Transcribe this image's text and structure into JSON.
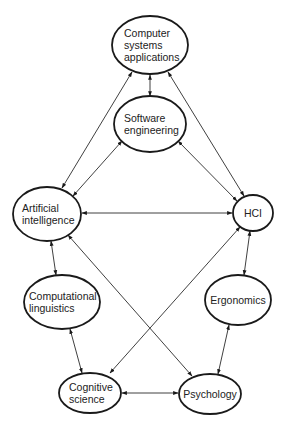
{
  "diagram": {
    "type": "relationship-network",
    "nodes": [
      {
        "id": "csa",
        "lines": [
          "Computer",
          "systems",
          "applications"
        ],
        "cx": 150,
        "cy": 45,
        "rx": 38,
        "ry": 29,
        "align": "start",
        "tx": 124
      },
      {
        "id": "se",
        "lines": [
          "Software",
          "engineering"
        ],
        "cx": 150,
        "cy": 124,
        "rx": 36,
        "ry": 28,
        "align": "start",
        "tx": 124
      },
      {
        "id": "ai",
        "lines": [
          "Artificial",
          "intelligence"
        ],
        "cx": 47,
        "cy": 214,
        "rx": 34,
        "ry": 27,
        "align": "start",
        "tx": 22
      },
      {
        "id": "hci",
        "lines": [
          "HCI"
        ],
        "cx": 253,
        "cy": 213,
        "rx": 20,
        "ry": 18,
        "align": "middle",
        "tx": 253
      },
      {
        "id": "cl",
        "lines": [
          "Computational",
          "linguistics"
        ],
        "cx": 62,
        "cy": 302,
        "rx": 38,
        "ry": 27,
        "align": "start",
        "tx": 29
      },
      {
        "id": "erg",
        "lines": [
          "Ergonomics"
        ],
        "cx": 238,
        "cy": 300,
        "rx": 33,
        "ry": 25,
        "align": "middle",
        "tx": 238
      },
      {
        "id": "cs",
        "lines": [
          "Cognitive",
          "science"
        ],
        "cx": 90,
        "cy": 393,
        "rx": 31,
        "ry": 20,
        "align": "start",
        "tx": 69
      },
      {
        "id": "psy",
        "lines": [
          "Psychology"
        ],
        "cx": 210,
        "cy": 394,
        "rx": 31,
        "ry": 20,
        "align": "middle",
        "tx": 210
      }
    ],
    "edges": [
      {
        "from": "csa",
        "to": "se",
        "x1": 150,
        "y1": 75,
        "x2": 150,
        "y2": 96
      },
      {
        "from": "csa",
        "to": "ai",
        "x1": 132,
        "y1": 72,
        "x2": 62,
        "y2": 188
      },
      {
        "from": "csa",
        "to": "hci",
        "x1": 168,
        "y1": 72,
        "x2": 244,
        "y2": 196
      },
      {
        "from": "se",
        "to": "ai",
        "x1": 122,
        "y1": 141,
        "x2": 73,
        "y2": 196
      },
      {
        "from": "se",
        "to": "hci",
        "x1": 178,
        "y1": 141,
        "x2": 237,
        "y2": 201
      },
      {
        "from": "ai",
        "to": "hci",
        "x1": 82,
        "y1": 213,
        "x2": 232,
        "y2": 213
      },
      {
        "from": "ai",
        "to": "cl",
        "x1": 51,
        "y1": 241,
        "x2": 56,
        "y2": 275
      },
      {
        "from": "ai",
        "to": "psy",
        "x1": 68,
        "y1": 235,
        "x2": 192,
        "y2": 376
      },
      {
        "from": "hci",
        "to": "cs",
        "x1": 240,
        "y1": 227,
        "x2": 110,
        "y2": 373
      },
      {
        "from": "hci",
        "to": "erg",
        "x1": 250,
        "y1": 231,
        "x2": 244,
        "y2": 275
      },
      {
        "from": "cl",
        "to": "cs",
        "x1": 70,
        "y1": 329,
        "x2": 82,
        "y2": 373
      },
      {
        "from": "erg",
        "to": "psy",
        "x1": 229,
        "y1": 325,
        "x2": 218,
        "y2": 374
      },
      {
        "from": "cs",
        "to": "psy",
        "x1": 122,
        "y1": 393,
        "x2": 178,
        "y2": 393
      }
    ],
    "colors": {
      "stroke": "#1a1a1a",
      "background": "#ffffff",
      "text": "#222222"
    }
  }
}
